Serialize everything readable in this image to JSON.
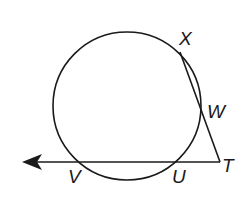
{
  "diagram": {
    "type": "circle-secant-geometry",
    "stroke_color": "#1a1a1a",
    "background": "#ffffff",
    "circle": {
      "cx": 127,
      "cy": 106,
      "r": 74
    },
    "points": {
      "X": {
        "label": "X",
        "x": 180,
        "y": 52
      },
      "W": {
        "label": "W",
        "x": 204,
        "y": 116
      },
      "T": {
        "label": "T",
        "x": 220,
        "y": 162
      },
      "U": {
        "label": "U",
        "x": 177,
        "y": 162
      },
      "V": {
        "label": "V",
        "x": 82,
        "y": 162
      }
    },
    "segments": [
      {
        "from": "X",
        "to": "T",
        "name": "secant-xt"
      }
    ],
    "rays": [
      {
        "from": "T",
        "through": "V",
        "name": "ray-tv",
        "arrow_end_x": 24
      }
    ],
    "labels": [
      {
        "text": "X",
        "x": 179,
        "y": 29
      },
      {
        "text": "W",
        "x": 208,
        "y": 102
      },
      {
        "text": "T",
        "x": 222,
        "y": 157
      },
      {
        "text": "U",
        "x": 172,
        "y": 167
      },
      {
        "text": "V",
        "x": 67,
        "y": 167
      }
    ]
  }
}
